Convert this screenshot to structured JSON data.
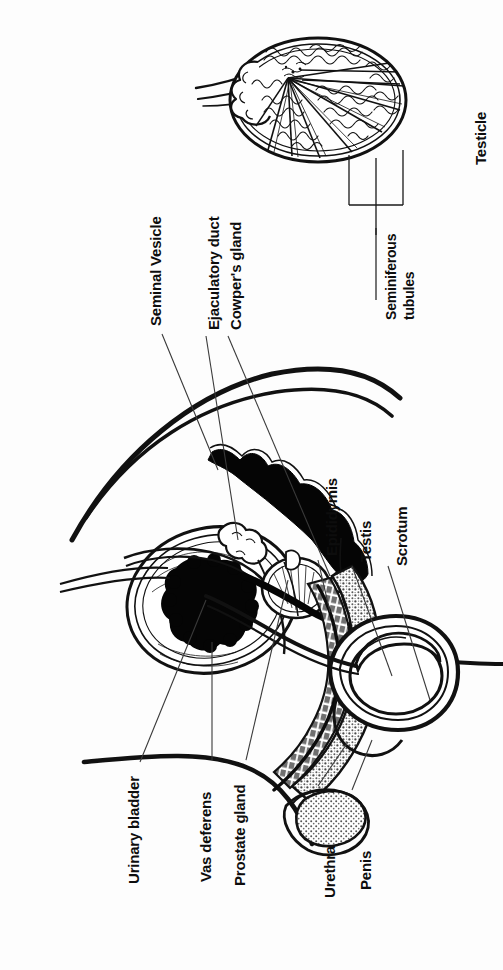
{
  "diagram": {
    "orientation": "labels rotated 90 degrees counter-clockwise",
    "background_color": "#fdfdfd",
    "ink_color": "#0d0d0d",
    "leader_line_color": "#3a3a3a"
  },
  "labels": {
    "seminal_vesicle": "Seminal Vesicle",
    "ejaculatory_duct": "Ejaculatory duct",
    "cowpers_gland": "Cowper's gland",
    "testicle": "Testicle",
    "seminiferous_tubules_line1": "Seminiferous",
    "seminiferous_tubules_line2": "tubules",
    "epididymis": "Epididymis",
    "testis": "Testis",
    "scrotum": "Scrotum",
    "urinary_bladder": "Urinary bladder",
    "vas_deferens": "Vas deferens",
    "prostate_gland": "Prostate gland",
    "urethra": "Urethra",
    "penis": "Penis"
  },
  "label_sizes": {
    "seminal_vesicle": 15,
    "ejaculatory_duct": 15,
    "cowpers_gland": 15,
    "testicle": 15,
    "seminiferous_tubules": 14,
    "epididymis": 15,
    "testis": 15,
    "scrotum": 15,
    "urinary_bladder": 15,
    "vas_deferens": 15,
    "prostate_gland": 15,
    "urethra": 15,
    "penis": 15
  },
  "structures": [
    "urinary bladder",
    "seminal vesicle",
    "ejaculatory duct",
    "prostate gland",
    "Cowper's gland",
    "vas deferens",
    "urethra",
    "penis",
    "epididymis",
    "testis",
    "scrotum",
    "testicle cross-section",
    "seminiferous tubules"
  ]
}
